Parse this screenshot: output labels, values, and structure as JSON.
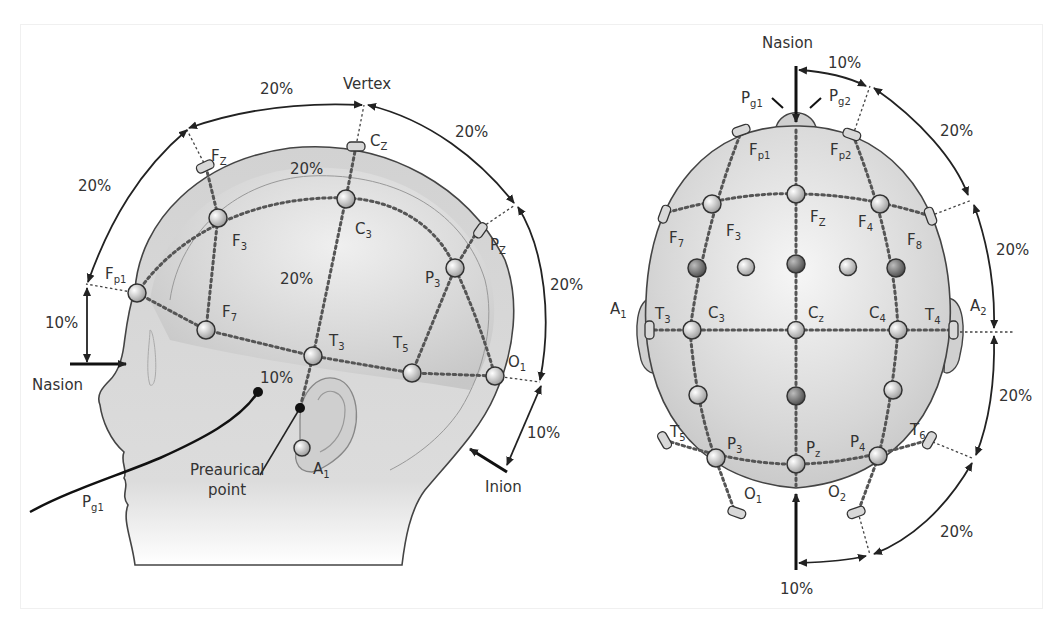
{
  "diagram": {
    "colors": {
      "background": "#ffffff",
      "head_fill": "#d4d4d4",
      "head_highlight": "#f2f2f2",
      "outline": "#444444",
      "text": "#333333"
    },
    "side_view": {
      "landmarks": {
        "vertex": "Vertex",
        "nasion": "Nasion",
        "inion": "Inion",
        "preauricular": "Preaurical point"
      },
      "electrodes": {
        "fz": {
          "main": "F",
          "sub": "Z"
        },
        "cz": {
          "main": "C",
          "sub": "Z"
        },
        "pz": {
          "main": "P",
          "sub": "Z"
        },
        "fp1": {
          "main": "F",
          "sub": "p1"
        },
        "f3": {
          "main": "F",
          "sub": "3"
        },
        "c3": {
          "main": "C",
          "sub": "3"
        },
        "p3": {
          "main": "P",
          "sub": "3"
        },
        "f7": {
          "main": "F",
          "sub": "7"
        },
        "t3": {
          "main": "T",
          "sub": "3"
        },
        "t5": {
          "main": "T",
          "sub": "5"
        },
        "o1": {
          "main": "O",
          "sub": "1"
        },
        "a1": {
          "main": "A",
          "sub": "1"
        },
        "pg1": {
          "main": "P",
          "sub": "g1"
        }
      },
      "percentages": {
        "top_left": "20%",
        "left": "20%",
        "top_right": "20%",
        "right": "20%",
        "nasion_gap": "10%",
        "inion_gap": "10%",
        "inner_top": "20%",
        "inner_center": "20%",
        "preauricular_gap": "10%"
      }
    },
    "top_view": {
      "landmarks": {
        "nasion": "Nasion"
      },
      "electrodes": {
        "pg1": {
          "main": "P",
          "sub": "g1"
        },
        "pg2": {
          "main": "P",
          "sub": "g2"
        },
        "fp1": {
          "main": "F",
          "sub": "p1"
        },
        "fp2": {
          "main": "F",
          "sub": "p2"
        },
        "f7": {
          "main": "F",
          "sub": "7"
        },
        "f3": {
          "main": "F",
          "sub": "3"
        },
        "fz": {
          "main": "F",
          "sub": "Z"
        },
        "f4": {
          "main": "F",
          "sub": "4"
        },
        "f8": {
          "main": "F",
          "sub": "8"
        },
        "a1": {
          "main": "A",
          "sub": "1"
        },
        "t3": {
          "main": "T",
          "sub": "3"
        },
        "c3": {
          "main": "C",
          "sub": "3"
        },
        "cz": {
          "main": "C",
          "sub": "z"
        },
        "c4": {
          "main": "C",
          "sub": "4"
        },
        "t4": {
          "main": "T",
          "sub": "4"
        },
        "a2": {
          "main": "A",
          "sub": "2"
        },
        "t5": {
          "main": "T",
          "sub": "5"
        },
        "p3": {
          "main": "P",
          "sub": "3"
        },
        "pz": {
          "main": "P",
          "sub": "z"
        },
        "p4": {
          "main": "P",
          "sub": "4"
        },
        "t6": {
          "main": "T",
          "sub": "6"
        },
        "o1": {
          "main": "O",
          "sub": "1"
        },
        "o2": {
          "main": "O",
          "sub": "2"
        }
      },
      "percentages": {
        "top": "10%",
        "upper_right": "20%",
        "mid_upper_right": "20%",
        "mid_lower_right": "20%",
        "lower_right": "20%",
        "bottom": "10%"
      }
    }
  }
}
